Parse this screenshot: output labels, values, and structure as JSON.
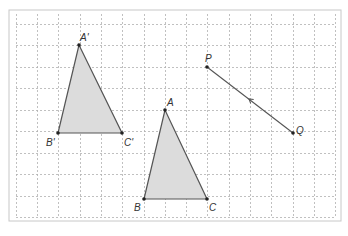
{
  "canvas": {
    "width": 348,
    "height": 236
  },
  "frame": {
    "x": 9,
    "y": 10,
    "width": 332,
    "height": 211,
    "stroke": "#c8c8c8"
  },
  "grid": {
    "x_lines": [
      16,
      37,
      58,
      80,
      101,
      122,
      144,
      165,
      186,
      207,
      229,
      250,
      271,
      293,
      314,
      335
    ],
    "y_lines": [
      24,
      45,
      67,
      88,
      110,
      131,
      153,
      174,
      196,
      217
    ],
    "x_min": 16,
    "x_max": 335,
    "y_min": 24,
    "y_max": 217,
    "color": "#b0b0b0",
    "dash": "2,2"
  },
  "colors": {
    "fill": "#dcdcdc",
    "stroke": "#555555",
    "point": "#222222",
    "label": "#333333"
  },
  "triangles": [
    {
      "name": "image-triangle",
      "vertices": [
        {
          "label": "A'",
          "x": 79,
          "y": 45,
          "lx": 80,
          "ly": 41
        },
        {
          "label": "B'",
          "x": 58,
          "y": 133,
          "lx": 46,
          "ly": 146
        },
        {
          "label": "C'",
          "x": 122,
          "y": 133,
          "lx": 124,
          "ly": 146
        }
      ]
    },
    {
      "name": "original-triangle",
      "vertices": [
        {
          "label": "A",
          "x": 165,
          "y": 110,
          "lx": 167,
          "ly": 106
        },
        {
          "label": "B",
          "x": 144,
          "y": 199,
          "lx": 134,
          "ly": 211
        },
        {
          "label": "C",
          "x": 207,
          "y": 199,
          "lx": 209,
          "ly": 211
        }
      ]
    }
  ],
  "vector": {
    "start": {
      "label": "P",
      "x": 207,
      "y": 67,
      "lx": 205,
      "ly": 62
    },
    "end": {
      "label": "Q",
      "x": 293,
      "y": 133,
      "lx": 296,
      "ly": 134
    },
    "arrow": {
      "x": 249,
      "y": 99,
      "direction": "toward-P"
    }
  }
}
